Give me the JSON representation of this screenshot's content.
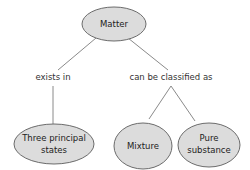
{
  "diagram": {
    "type": "concept-map",
    "colors": {
      "node_fill": "#dcdcdc",
      "node_stroke": "#6b6b6b",
      "edge": "#8a8a8a",
      "text": "#222222"
    },
    "nodes": {
      "matter": {
        "label": "Matter"
      },
      "three_states": {
        "line1": "Three principal",
        "line2": "states"
      },
      "mixture": {
        "label": "Mixture"
      },
      "pure_substance": {
        "line1": "Pure",
        "line2": "substance"
      }
    },
    "links": {
      "exists_in": "exists in",
      "classified_as": "can be classified as"
    }
  }
}
